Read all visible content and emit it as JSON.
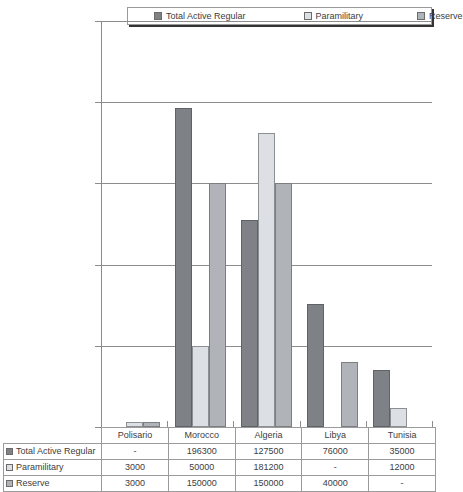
{
  "chart_data": {
    "type": "bar",
    "title": "",
    "xlabel": "",
    "ylabel": "",
    "ylim": [
      0,
      250000
    ],
    "ytick_labels": [
      "250000",
      "200000",
      "150000",
      "100000",
      "50000",
      "0"
    ],
    "ytick_values": [
      250000,
      200000,
      150000,
      100000,
      50000,
      0
    ],
    "grid": true,
    "legend_position": "top",
    "categories": [
      "Polisario",
      "Morocco",
      "Algeria",
      "Libya",
      "Tunisia"
    ],
    "series": [
      {
        "name": "Total Active Regular",
        "color": "#7e8186",
        "values": [
          null,
          196300,
          127500,
          76000,
          35000
        ],
        "display": [
          "-",
          "196300",
          "127500",
          "76000",
          "35000"
        ]
      },
      {
        "name": "Paramilitary",
        "color": "#dce0e4",
        "values": [
          3000,
          50000,
          181200,
          null,
          12000
        ],
        "display": [
          "3000",
          "50000",
          "181200",
          "-",
          "12000"
        ]
      },
      {
        "name": "Reserve",
        "color": "#b0b3b7",
        "values": [
          3000,
          150000,
          150000,
          40000,
          null
        ],
        "display": [
          "3000",
          "150000",
          "150000",
          "40000",
          "-"
        ]
      }
    ]
  },
  "legend": {
    "entries": [
      {
        "label": "Total Active Regular",
        "color": "#7e8186"
      },
      {
        "label": "Paramilitary",
        "color": "#dce0e4"
      },
      {
        "label": "Reserve",
        "color": "#b0b3b7"
      }
    ]
  },
  "table": {
    "corner_label": "",
    "column_headers": [
      "Polisario",
      "Morocco",
      "Algeria",
      "Libya",
      "Tunisia"
    ],
    "rows": [
      {
        "label": "Total Active Regular",
        "swatch": "s0",
        "cells": [
          "-",
          "196300",
          "127500",
          "76000",
          "35000"
        ]
      },
      {
        "label": "Paramilitary",
        "swatch": "s1",
        "cells": [
          "3000",
          "50000",
          "181200",
          "-",
          "12000"
        ]
      },
      {
        "label": "Reserve",
        "swatch": "s2",
        "cells": [
          "3000",
          "150000",
          "150000",
          "40000",
          "-"
        ]
      }
    ]
  }
}
